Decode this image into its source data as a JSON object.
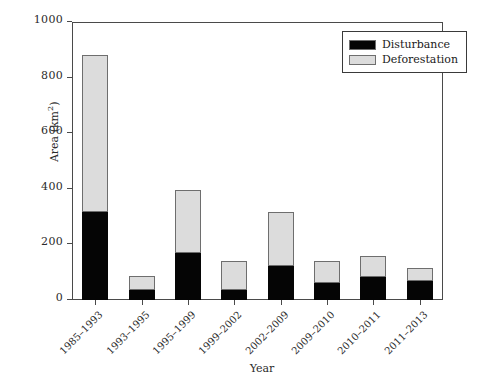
{
  "chart_data": {
    "type": "bar",
    "subtype": "stacked-bar",
    "title": "",
    "xlabel": "Year",
    "ylabel": "Area (km2)",
    "ylabel_display": "Area (km",
    "ylabel_sup": "2",
    "ylabel_suffix": ")",
    "categories": [
      "1985–1993",
      "1993–1995",
      "1995–1999",
      "1999–2002",
      "2002–2009",
      "2009–2010",
      "2010–2011",
      "2011–2013"
    ],
    "series": [
      {
        "name": "Disturbance",
        "color": "#050505",
        "values": [
          317,
          36,
          169,
          36,
          122,
          61,
          83,
          68
        ]
      },
      {
        "name": "Deforestation",
        "color": "#dcdcdc",
        "values": [
          564,
          50,
          227,
          104,
          195,
          79,
          75,
          47
        ]
      }
    ],
    "totals": [
      881,
      86,
      396,
      140,
      317,
      140,
      158,
      115
    ],
    "ylim": [
      0,
      1000
    ],
    "yticks": [
      0,
      200,
      400,
      600,
      800,
      1000
    ],
    "ytick_labels": [
      "0",
      "200",
      "400",
      "600",
      "800",
      "1000"
    ],
    "grid": false,
    "legend_position": "top-right",
    "stack_order": [
      "Disturbance",
      "Deforestation"
    ]
  },
  "legend": {
    "items": [
      {
        "label": "Disturbance",
        "color": "#050505"
      },
      {
        "label": "Deforestation",
        "color": "#dcdcdc"
      }
    ]
  }
}
